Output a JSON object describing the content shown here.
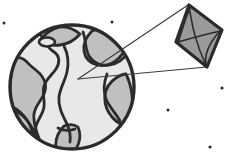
{
  "illustration": {
    "title": "Earth with kite viewed through a pointer cone",
    "background_color": "#ffffff",
    "style": "clipart line art, thick dark outlines, flat gray fills"
  },
  "palette": {
    "outline": "#2b2b2b",
    "thin_line": "#3a3a3a",
    "globe_land": "#e8e8e8",
    "globe_ocean": "#c0c0c0",
    "kite_fill": "#9a9a9a",
    "kite_fill_shadow": "#8a8a8a",
    "speck": "#2b2b2b",
    "background": "#ffffff"
  },
  "globe": {
    "label": "earth-globe",
    "center_x": 72,
    "center_y": 87,
    "radius": 62,
    "outline_width": 3.4,
    "land_color": "#e8e8e8",
    "ocean_color": "#c0c0c0",
    "ocean_regions": [
      {
        "name": "ocean-west-left-limb",
        "path": "M 16 58 C 11 68 10 80 10 90 C 10 104 14 116 22 127 C 27 133 33 138 40 141 C 36 131 33 122 34 114 C 35 106 41 101 44 94 C 47 87 45 80 41 75 C 37 70 31 67 27 62 C 24 59 20 57 16 58 Z"
      },
      {
        "name": "ocean-north-cap",
        "path": "M 60 27 C 52 29 45 34 40 40 C 46 44 53 46 60 45 C 68 44 75 40 80 34 C 74 29 67 26 60 27 Z"
      },
      {
        "name": "ocean-northeast",
        "path": "M 92 31 C 86 37 83 44 84 51 C 85 58 90 63 97 65 C 105 67 113 64 119 58 C 124 53 127 46 127 39 C 120 33 112 29 104 28 C 100 28 96 29 92 31 Z"
      },
      {
        "name": "ocean-east-limb",
        "path": "M 116 78 C 110 82 106 88 105 95 C 104 103 107 111 112 117 C 117 123 124 126 130 125 C 132 115 133 105 132 95 C 131 87 129 80 126 74 C 123 74 119 76 116 78 Z"
      },
      {
        "name": "ocean-southwest",
        "path": "M 14 110 C 12 118 14 126 19 133 C 24 140 32 145 40 147 C 38 138 34 130 29 123 C 25 117 20 113 14 110 Z"
      },
      {
        "name": "ocean-south",
        "path": "M 64 126 C 58 132 55 140 56 148 C 62 150 69 150 76 149 C 80 142 81 134 78 127 C 74 124 69 124 64 126 Z"
      }
    ],
    "land_outlines": [
      {
        "name": "continent-main-sprawl",
        "path": "M 41 35 C 44 42 48 48 54 52 C 60 56 60 63 56 69 C 52 75 46 79 44 86 C 42 93 45 100 44 107 C 43 114 38 119 36 126 C 34 133 37 140 41 146"
      },
      {
        "name": "continent-central-ridge",
        "path": "M 64 46 C 68 54 69 63 67 72 C 65 81 60 88 59 97 C 58 106 62 114 66 122 C 69 128 71 135 70 142"
      },
      {
        "name": "continent-northeast-edge",
        "path": "M 83 32 C 86 40 85 49 89 56 C 93 63 101 66 109 65 C 117 64 124 59 128 52"
      },
      {
        "name": "continent-east-edge",
        "path": "M 107 74 C 104 82 103 91 106 99 C 109 107 116 113 120 121"
      },
      {
        "name": "continent-southwest-edge",
        "path": "M 11 106 C 17 109 23 114 27 120 C 31 126 33 133 34 140"
      },
      {
        "name": "continent-south-edge",
        "path": "M 58 128 C 63 131 69 131 75 129"
      }
    ],
    "lake": {
      "name": "lake-ring",
      "cx": 47,
      "cy": 42,
      "rx": 8,
      "ry": 4.5,
      "fill": "#e8e8e8"
    }
  },
  "kite": {
    "label": "kite-diamond",
    "vertices": {
      "top": [
        189,
        5
      ],
      "right": [
        222,
        30
      ],
      "bottom": [
        207,
        67
      ],
      "left": [
        176,
        42
      ]
    },
    "fill_color": "#9a9a9a",
    "outline_width": 3.2,
    "spars": [
      {
        "name": "kite-spar-vertical",
        "path": "M 189 7 C 192 22 194 40 206 65"
      },
      {
        "name": "kite-spar-horizontal",
        "path": "M 178 42 C 192 38 206 34 221 31"
      },
      {
        "name": "kite-spar-cross-curve",
        "path": "M 190 8 C 184 22 181 34 178 43"
      },
      {
        "name": "kite-spar-lower-curve",
        "path": "M 220 31 C 210 42 204 54 206 65"
      }
    ]
  },
  "pointer_cone": {
    "label": "magnifier-cone",
    "apex": [
      78,
      79
    ],
    "upper_endpoint": [
      188,
      5
    ],
    "lower_endpoint": [
      207,
      67
    ],
    "stroke_width": 1.1,
    "description": "two thin converging lines from a point on the globe to the kite"
  },
  "specks": [
    {
      "name": "speck-upper-left",
      "cx": 4,
      "cy": 23,
      "r": 1.5
    },
    {
      "name": "speck-upper-mid",
      "cx": 112,
      "cy": 22,
      "r": 1.5
    },
    {
      "name": "speck-right-mid",
      "cx": 222,
      "cy": 88,
      "r": 1.6
    },
    {
      "name": "speck-lower-mid",
      "cx": 168,
      "cy": 110,
      "r": 1.5
    },
    {
      "name": "speck-lower-right",
      "cx": 210,
      "cy": 147,
      "r": 1.6
    }
  ]
}
